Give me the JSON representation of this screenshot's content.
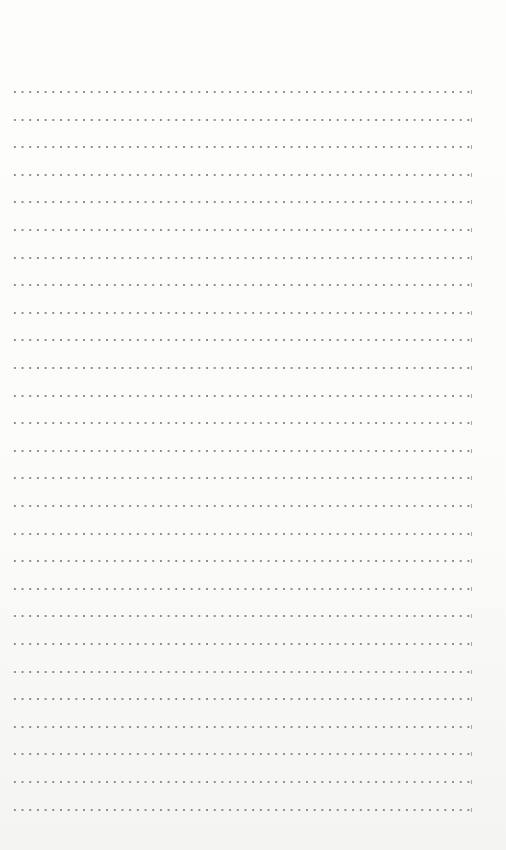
{
  "page": {
    "type": "dotted-lined-paper",
    "background_color": "#fbfbfa",
    "dot_color": "#8d8d8d",
    "line_count": 27,
    "first_line_y": 91,
    "line_spacing": 27.6,
    "line_left_x": 11,
    "line_right_x": 471,
    "dot_spacing": 7.7
  },
  "text_content": []
}
